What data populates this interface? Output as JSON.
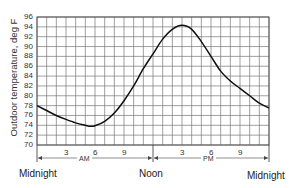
{
  "chart_data": {
    "type": "line",
    "title": "",
    "xlabel": "",
    "ylabel": "Outdoor temperature, deg F",
    "ylim": [
      70,
      96
    ],
    "yticks": [
      70,
      72,
      74,
      76,
      78,
      80,
      82,
      84,
      86,
      88,
      90,
      92,
      94,
      96
    ],
    "xlim": [
      0,
      24
    ],
    "x_tick_labels": [
      "3",
      "6",
      "9",
      "3",
      "6",
      "9"
    ],
    "x_tick_positions_hours": [
      3,
      6,
      9,
      15,
      18,
      21
    ],
    "x_period_labels": {
      "am": "AM",
      "pm": "PM"
    },
    "x_landmarks": {
      "start": "Midnight",
      "middle": "Noon",
      "end": "Midnight"
    },
    "grid": true,
    "series": [
      {
        "name": "Outdoor temperature",
        "x": [
          0,
          1,
          2,
          3,
          4,
          5,
          5.5,
          6,
          7,
          8,
          9,
          10,
          11,
          12,
          13,
          14,
          15,
          16,
          17,
          18,
          19,
          20,
          21,
          22,
          23,
          24
        ],
        "values": [
          78,
          77,
          76,
          75.2,
          74.5,
          74,
          73.8,
          73.9,
          74.8,
          76.5,
          79,
          82,
          85.5,
          88.5,
          91.5,
          93.5,
          94.3,
          93.5,
          91,
          88,
          85,
          83,
          81.5,
          80,
          78.5,
          77.5
        ]
      }
    ]
  },
  "labels": {
    "ylabel": "Outdoor temperature, deg F",
    "am": "AM",
    "pm": "PM",
    "midnight_start": "Midnight",
    "noon": "Noon",
    "midnight_end": "Midnight"
  }
}
